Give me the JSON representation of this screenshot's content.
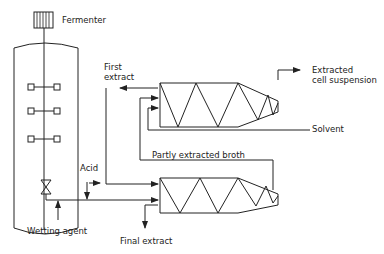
{
  "diagram": {
    "labels": {
      "fermenter": "Fermenter",
      "first_extract_line1": "First",
      "first_extract_line2": "extract",
      "extracted_line1": "Extracted",
      "extracted_line2": "cell suspension",
      "solvent": "Solvent",
      "partly_extracted_broth": "Partly extracted broth",
      "acid": "Acid",
      "wetting_agent": "Wetting agent",
      "final_extract": "Final extract"
    },
    "colors": {
      "line": "#222222",
      "background": "#ffffff"
    }
  }
}
